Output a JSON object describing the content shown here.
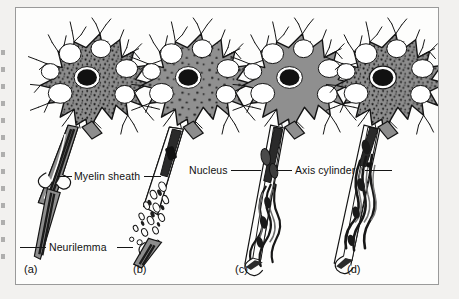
{
  "figure": {
    "background_color": "#f2f1ef",
    "plate_color": "#fdfdfc",
    "border_color": "#9a9a9a",
    "ink_color": "#111111",
    "soma_gray": "#8d8d8d",
    "soma_gray_light": "#9a9a9a",
    "nucleus_color": "#111111"
  },
  "labels": [
    {
      "id": "myelin-sheath",
      "text": "Myelin sheath"
    },
    {
      "id": "neurilemma",
      "text": "Neurilemma"
    },
    {
      "id": "nucleus",
      "text": "Nucleus"
    },
    {
      "id": "axis-cylinder",
      "text": "Axis cylinder"
    }
  ],
  "panels": [
    {
      "id": "a",
      "tag": "(a)",
      "stage": "normal neuron with intact myelinated axon"
    },
    {
      "id": "b",
      "tag": "(b)",
      "stage": "degeneration: axon and myelin fragment into debris"
    },
    {
      "id": "c",
      "tag": "(c)",
      "stage": "regeneration: Schwann cell tube with sprouting fibres"
    },
    {
      "id": "d",
      "tag": "(d)",
      "stage": "restored axon with remyelinated fibres"
    }
  ]
}
